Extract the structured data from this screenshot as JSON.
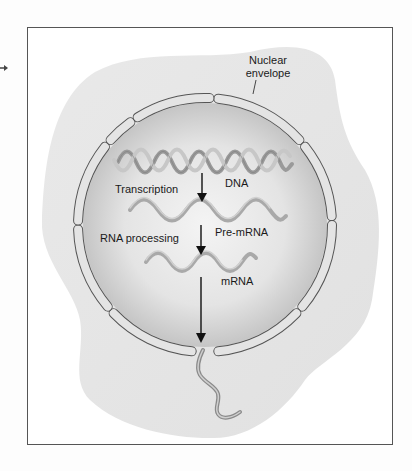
{
  "diagram": {
    "labels": {
      "nuclear_envelope_line1": "Nuclear",
      "nuclear_envelope_line2": "envelope",
      "dna": "DNA",
      "transcription": "Transcription",
      "pre_mrna": "Pre-mRNA",
      "rna_processing": "RNA processing",
      "mrna": "mRNA"
    },
    "flow": [
      {
        "from": "DNA",
        "process": "Transcription",
        "to": "Pre-mRNA"
      },
      {
        "from": "Pre-mRNA",
        "process": "RNA processing",
        "to": "mRNA"
      },
      {
        "from": "mRNA",
        "process": "export",
        "to": "cytoplasm"
      }
    ],
    "colors": {
      "frame": "#555555",
      "cytoplasm": "#e6e6e6",
      "nucleus_center": "#f2f2f2",
      "nucleus_edge": "#bdbdbd",
      "envelope_fill": "#e2e2e2",
      "envelope_stroke": "#555555",
      "strand": "#a8a8a8",
      "arrow": "#111111"
    }
  }
}
